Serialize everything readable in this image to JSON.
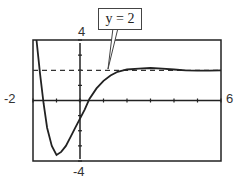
{
  "chart_data": {
    "type": "line",
    "title": "",
    "xlabel": "",
    "ylabel": "",
    "xlim": [
      -2,
      6
    ],
    "ylim": [
      -4,
      4
    ],
    "window_labels": {
      "xmin": "-2",
      "xmax": "6",
      "ymin": "-4",
      "ymax": "4"
    },
    "grid": false,
    "x_ticks_every": 1,
    "y_ticks_every": 1,
    "annotations": [
      {
        "text": "y = 2",
        "type": "callout",
        "points_to": "horizontal asymptote"
      }
    ],
    "series": [
      {
        "name": "f(x)",
        "style": "solid",
        "x": [
          -1.85,
          -1.7,
          -1.55,
          -1.4,
          -1.2,
          -1.0,
          -0.8,
          -0.6,
          -0.4,
          -0.2,
          0.0,
          0.2,
          0.4,
          0.7,
          1.0,
          1.3,
          1.6,
          2.0,
          2.5,
          3.0,
          3.5,
          4.0,
          4.5,
          5.0,
          5.5,
          6.0
        ],
        "y": [
          4.0,
          1.8,
          -0.2,
          -1.8,
          -3.0,
          -3.6,
          -3.4,
          -3.0,
          -2.4,
          -1.8,
          -1.2,
          -0.6,
          0.1,
          0.8,
          1.3,
          1.65,
          1.9,
          2.05,
          2.1,
          2.15,
          2.1,
          2.05,
          2.0,
          1.98,
          1.98,
          2.0
        ]
      },
      {
        "name": "y = 2",
        "style": "dashed",
        "x": [
          -2,
          6
        ],
        "y": [
          2,
          2
        ]
      }
    ]
  }
}
